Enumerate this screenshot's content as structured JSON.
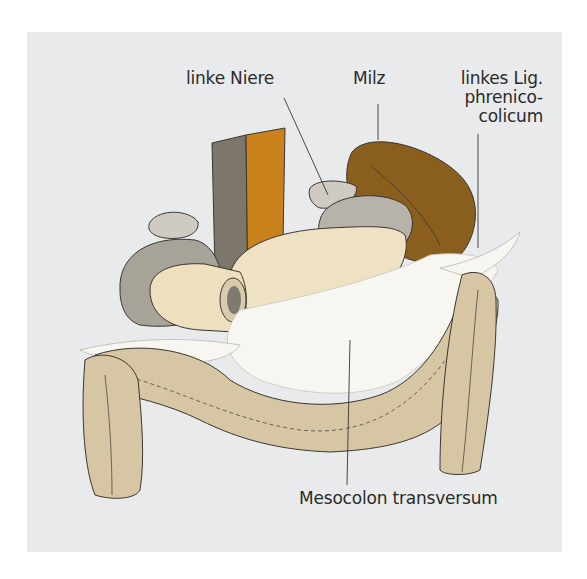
{
  "figure": {
    "labels": {
      "linke_niere": "linke Niere",
      "milz": "Milz",
      "lig_line1": "linkes Lig.",
      "lig_line2": "phrenico-",
      "lig_line3": "colicum",
      "mesocolon": "Mesocolon transversum"
    },
    "colors": {
      "background_panel": "#e9eaec",
      "colon": "#d6c6a4",
      "spleen": "#8a5f1e",
      "pancreas": "#efe2c4",
      "kidney": "#b7b2aa",
      "vessel_gray": "#7d766b",
      "vessel_orange": "#c9821c",
      "mesentery": "#f7f6f1",
      "outline": "#3a3632"
    }
  }
}
